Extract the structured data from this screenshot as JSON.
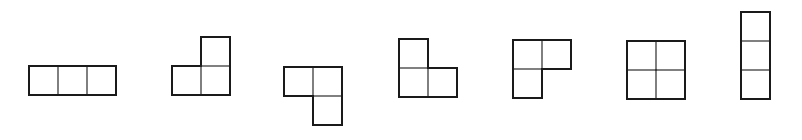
{
  "diagram": {
    "cell_size": 29,
    "stroke_color": "#1a1a1a",
    "background": "#ffffff",
    "shapes": [
      {
        "name": "horizontal-i-tromino",
        "origin": [
          29,
          66
        ],
        "cells": [
          [
            0,
            0
          ],
          [
            1,
            0
          ],
          [
            2,
            0
          ]
        ]
      },
      {
        "name": "l-tromino-up-right",
        "origin": [
          172,
          37
        ],
        "cells": [
          [
            1,
            0
          ],
          [
            0,
            1
          ],
          [
            1,
            1
          ]
        ]
      },
      {
        "name": "l-tromino-down-right",
        "origin": [
          284,
          67
        ],
        "cells": [
          [
            0,
            0
          ],
          [
            1,
            0
          ],
          [
            1,
            1
          ]
        ]
      },
      {
        "name": "l-tromino-up-left",
        "origin": [
          399,
          39
        ],
        "cells": [
          [
            0,
            0
          ],
          [
            0,
            1
          ],
          [
            1,
            1
          ]
        ]
      },
      {
        "name": "l-tromino-down-left",
        "origin": [
          513,
          40
        ],
        "cells": [
          [
            0,
            0
          ],
          [
            1,
            0
          ],
          [
            0,
            1
          ]
        ]
      },
      {
        "name": "o-tetromino-square",
        "origin": [
          627,
          41
        ],
        "cells": [
          [
            0,
            0
          ],
          [
            1,
            0
          ],
          [
            0,
            1
          ],
          [
            1,
            1
          ]
        ]
      },
      {
        "name": "vertical-i-tromino",
        "origin": [
          741,
          12
        ],
        "cells": [
          [
            0,
            0
          ],
          [
            0,
            1
          ],
          [
            0,
            2
          ]
        ]
      }
    ]
  }
}
